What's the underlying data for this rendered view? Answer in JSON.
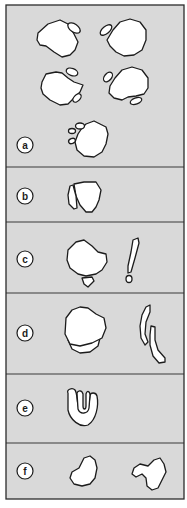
{
  "figure": {
    "background": "#d9d9d9",
    "outline_color": "#1c1c1c",
    "panels": [
      {
        "id": "a",
        "label": "a",
        "top": 5,
        "bottom": 167
      },
      {
        "id": "b",
        "label": "b",
        "top": 167,
        "bottom": 222
      },
      {
        "id": "c",
        "label": "c",
        "top": 222,
        "bottom": 293
      },
      {
        "id": "d",
        "label": "d",
        "top": 293,
        "bottom": 374
      },
      {
        "id": "e",
        "label": "e",
        "top": 374,
        "bottom": 443
      },
      {
        "id": "f",
        "label": "f",
        "top": 443,
        "bottom": 499
      }
    ]
  }
}
